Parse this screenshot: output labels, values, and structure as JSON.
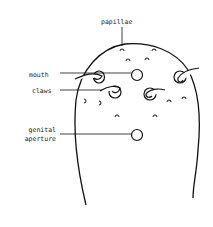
{
  "diagram": {
    "labels": {
      "papillae": "papillae",
      "mouth": "mouth",
      "claws": "claws",
      "genital_line1": "genital",
      "genital_line2": "aperture"
    },
    "colors": {
      "stroke": "#111111",
      "text": "#222222",
      "background": "#ffffff"
    }
  }
}
